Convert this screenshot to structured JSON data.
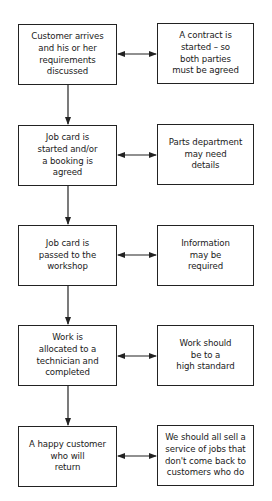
{
  "diagram": {
    "type": "flowchart",
    "steps": [
      {
        "main": "Customer arrives\nand his or her\nrequirements\ndiscussed",
        "note": "A contract is\nstarted – so\nboth parties\nmust be agreed"
      },
      {
        "main": "Job card is\nstarted and/or\na booking is\nagreed",
        "note": "Parts department\nmay need\ndetails"
      },
      {
        "main": "Job card is\npassed to the\nworkshop",
        "note": "Information\nmay be\nrequired"
      },
      {
        "main": "Work is\nallocated to a\ntechnician and\ncompleted",
        "note": "Work should\nbe to a\nhigh standard"
      },
      {
        "main": "A happy customer\nwho will\nreturn",
        "note": "We should all sell a\nservice of jobs that\ndon't come back to\ncustomers who do"
      }
    ],
    "colors": {
      "line": "#222222",
      "background": "#ffffff",
      "text": "#1a1a1a"
    }
  }
}
